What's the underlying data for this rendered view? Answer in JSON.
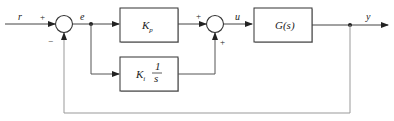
{
  "diagram": {
    "type": "PI control loop block diagram",
    "signals": {
      "reference": "r",
      "error": "e",
      "control": "u",
      "output": "y"
    },
    "summing_junction_1": {
      "plus_sign": "+",
      "minus_sign": "−"
    },
    "summing_junction_2": {
      "plus_top": "+",
      "plus_bottom": "+"
    },
    "blocks": {
      "proportional": {
        "gain": "K",
        "subscript": "p"
      },
      "integral": {
        "gain": "K",
        "subscript": "i",
        "numerator": "1",
        "denominator": "s"
      },
      "plant": {
        "label": "G(s)"
      }
    },
    "colors": {
      "stroke": "#333333",
      "feedback_stroke": "#999999",
      "block_shadow": "#bbbbbb"
    }
  }
}
